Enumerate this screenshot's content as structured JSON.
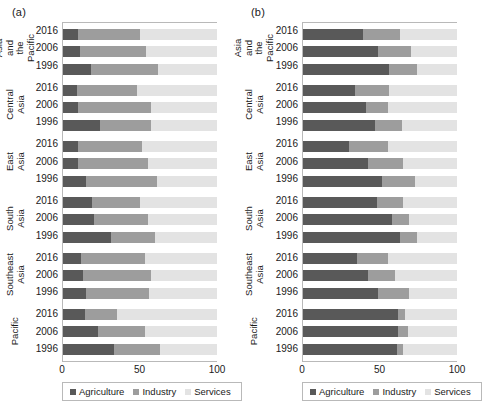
{
  "figure": {
    "panels": [
      {
        "tag": "(a)"
      },
      {
        "tag": "(b)"
      }
    ]
  },
  "legend": {
    "items": [
      {
        "label": "Agriculture",
        "color": "#595959",
        "swatch": "square-swatch-agriculture"
      },
      {
        "label": "Industry",
        "color": "#9d9d9d",
        "swatch": "square-swatch-industry"
      },
      {
        "label": "Services",
        "color": "#e3e3e3",
        "swatch": "square-swatch-services"
      }
    ]
  },
  "axis": {
    "ticks": [
      "0",
      "50",
      "100"
    ],
    "min": 0,
    "max": 100
  },
  "groups": [
    {
      "line1": "Asia and",
      "line2": "the Pacific",
      "years": [
        "2016",
        "2006",
        "1996"
      ]
    },
    {
      "line1": "Central",
      "line2": "Asia",
      "years": [
        "2016",
        "2006",
        "1996"
      ]
    },
    {
      "line1": "East",
      "line2": "Asia",
      "years": [
        "2016",
        "2006",
        "1996"
      ]
    },
    {
      "line1": "South",
      "line2": "Asia",
      "years": [
        "2016",
        "2006",
        "1996"
      ]
    },
    {
      "line1": "Southeast",
      "line2": "Asia",
      "years": [
        "2016",
        "2006",
        "1996"
      ]
    },
    {
      "line1": "",
      "line2": "Pacific",
      "years": [
        "2016",
        "2006",
        "1996"
      ]
    }
  ],
  "chart_data": [
    {
      "type": "bar",
      "orientation": "horizontal",
      "stacked": true,
      "panel": "(a)",
      "title": "",
      "xlabel": "",
      "ylabel": "",
      "xlim": [
        0,
        100
      ],
      "xticks": [
        0,
        50,
        100
      ],
      "grid": false,
      "legend_position": "bottom-left",
      "categories": [
        "Asia and the Pacific 2016",
        "Asia and the Pacific 2006",
        "Asia and the Pacific 1996",
        "Central Asia 2016",
        "Central Asia 2006",
        "Central Asia 1996",
        "East Asia 2016",
        "East Asia 2006",
        "East Asia 1996",
        "South Asia 2016",
        "South Asia 2006",
        "South Asia 1996",
        "Southeast Asia 2016",
        "Southeast Asia 2006",
        "Southeast Asia 1996",
        "Pacific 2016",
        "Pacific 2006",
        "Pacific 1996"
      ],
      "series": [
        {
          "name": "Agriculture",
          "color": "#595959",
          "values": [
            10,
            11,
            18,
            9,
            10,
            24,
            10,
            10,
            15,
            19,
            20,
            31,
            12,
            13,
            15,
            14,
            23,
            33
          ]
        },
        {
          "name": "Industry",
          "color": "#9d9d9d",
          "values": [
            40,
            43,
            44,
            39,
            47,
            33,
            41,
            45,
            46,
            31,
            35,
            29,
            41,
            44,
            41,
            21,
            30,
            30
          ]
        },
        {
          "name": "Services",
          "color": "#e3e3e3",
          "values": [
            50,
            46,
            38,
            52,
            43,
            43,
            49,
            45,
            39,
            50,
            45,
            40,
            47,
            43,
            44,
            65,
            47,
            37
          ]
        }
      ]
    },
    {
      "type": "bar",
      "orientation": "horizontal",
      "stacked": true,
      "panel": "(b)",
      "title": "",
      "xlabel": "",
      "ylabel": "",
      "xlim": [
        0,
        100
      ],
      "xticks": [
        0,
        50,
        100
      ],
      "grid": false,
      "legend_position": "bottom-left",
      "categories": [
        "Asia and the Pacific 2016",
        "Asia and the Pacific 2006",
        "Asia and the Pacific 1996",
        "Central Asia 2016",
        "Central Asia 2006",
        "Central Asia 1996",
        "East Asia 2016",
        "East Asia 2006",
        "East Asia 1996",
        "South Asia 2016",
        "South Asia 2006",
        "South Asia 1996",
        "Southeast Asia 2016",
        "Southeast Asia 2006",
        "Southeast Asia 1996",
        "Pacific 2016",
        "Pacific 2006",
        "Pacific 1996"
      ],
      "series": [
        {
          "name": "Agriculture",
          "color": "#595959",
          "values": [
            39,
            49,
            56,
            34,
            41,
            47,
            30,
            42,
            51,
            48,
            58,
            63,
            35,
            42,
            49,
            62,
            62,
            61
          ]
        },
        {
          "name": "Industry",
          "color": "#9d9d9d",
          "values": [
            24,
            21,
            18,
            22,
            14,
            17,
            25,
            23,
            22,
            17,
            11,
            11,
            20,
            18,
            20,
            4,
            6,
            4
          ]
        },
        {
          "name": "Services",
          "color": "#e3e3e3",
          "values": [
            37,
            30,
            26,
            44,
            45,
            36,
            45,
            35,
            27,
            35,
            31,
            26,
            45,
            40,
            31,
            34,
            32,
            35
          ]
        }
      ]
    }
  ]
}
